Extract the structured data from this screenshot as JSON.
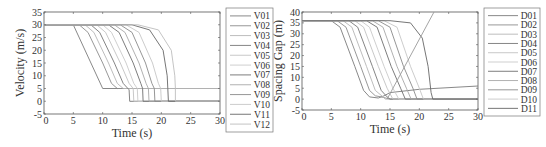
{
  "chart_data": [
    {
      "type": "line",
      "id": "velocity",
      "xlabel": "Time (s)",
      "ylabel": "Velocity (m/s)",
      "xlim": [
        0,
        30
      ],
      "ylim": [
        -5,
        35
      ],
      "xticks": [
        0,
        5,
        10,
        15,
        20,
        25,
        30
      ],
      "yticks": [
        -5,
        0,
        5,
        10,
        15,
        20,
        25,
        30,
        35
      ],
      "grid": false,
      "legend_position": "outside-right",
      "frame": {
        "x0": 44,
        "x1": 220,
        "y0": 114,
        "y1": 12
      },
      "legend_box": {
        "x": 226,
        "y": 8,
        "w": 47,
        "h": 124
      },
      "series": [
        {
          "name": "V01",
          "color": "#7a7a7a",
          "points": [
            [
              0,
              30
            ],
            [
              5,
              30
            ],
            [
              10,
              5
            ],
            [
              30,
              5
            ]
          ]
        },
        {
          "name": "V02",
          "color": "#8c8c8c",
          "points": [
            [
              0,
              30
            ],
            [
              6,
              30
            ],
            [
              7.5,
              27
            ],
            [
              10,
              15
            ],
            [
              11.5,
              7
            ],
            [
              12.5,
              5
            ],
            [
              30,
              5
            ]
          ]
        },
        {
          "name": "V03",
          "color": "#b5b5b5",
          "points": [
            [
              0,
              30
            ],
            [
              7,
              30
            ],
            [
              8.5,
              27
            ],
            [
              11,
              15
            ],
            [
              12.5,
              7
            ],
            [
              13.5,
              5
            ],
            [
              30,
              5
            ]
          ]
        },
        {
          "name": "V04",
          "color": "#777777",
          "points": [
            [
              0,
              30
            ],
            [
              8,
              30
            ],
            [
              9.5,
              27
            ],
            [
              12,
              15
            ],
            [
              13.5,
              7
            ],
            [
              14.5,
              4.5
            ],
            [
              14.6,
              0
            ],
            [
              30,
              0
            ]
          ]
        },
        {
          "name": "V05",
          "color": "#c2c2c2",
          "points": [
            [
              0,
              30
            ],
            [
              9,
              30
            ],
            [
              10.5,
              27
            ],
            [
              13,
              15
            ],
            [
              14.5,
              7
            ],
            [
              15.2,
              5
            ],
            [
              15.3,
              0
            ],
            [
              30,
              0
            ]
          ]
        },
        {
          "name": "V06",
          "color": "#c9c9c9",
          "points": [
            [
              0,
              30
            ],
            [
              10,
              30
            ],
            [
              11.5,
              27
            ],
            [
              14,
              15
            ],
            [
              15.3,
              7
            ],
            [
              15.9,
              5
            ],
            [
              16,
              0
            ],
            [
              30,
              0
            ]
          ]
        },
        {
          "name": "V07",
          "color": "#6e6e6e",
          "points": [
            [
              0,
              30
            ],
            [
              11,
              30
            ],
            [
              12.8,
              27
            ],
            [
              15.2,
              15
            ],
            [
              16.5,
              7
            ],
            [
              16.8,
              5
            ],
            [
              16.9,
              0
            ],
            [
              30,
              0
            ]
          ]
        },
        {
          "name": "V08",
          "color": "#a8a8a8",
          "points": [
            [
              0,
              30
            ],
            [
              12,
              30
            ],
            [
              13.8,
              27
            ],
            [
              16.2,
              15
            ],
            [
              17.4,
              7
            ],
            [
              17.8,
              5
            ],
            [
              17.9,
              0
            ],
            [
              30,
              0
            ]
          ]
        },
        {
          "name": "V09",
          "color": "#8a8a8a",
          "points": [
            [
              0,
              30
            ],
            [
              13,
              30
            ],
            [
              15,
              27
            ],
            [
              17.3,
              15
            ],
            [
              18.4,
              7
            ],
            [
              18.8,
              5
            ],
            [
              18.9,
              0
            ],
            [
              30,
              0
            ]
          ]
        },
        {
          "name": "V10",
          "color": "#c6c6c6",
          "points": [
            [
              0,
              30
            ],
            [
              14,
              30
            ],
            [
              16.2,
              27
            ],
            [
              18.5,
              15
            ],
            [
              19.5,
              7
            ],
            [
              19.9,
              5
            ],
            [
              20,
              0
            ],
            [
              30,
              0
            ]
          ]
        },
        {
          "name": "V11",
          "color": "#666666",
          "points": [
            [
              0,
              30
            ],
            [
              15,
              30
            ],
            [
              18,
              28
            ],
            [
              20.3,
              20
            ],
            [
              21,
              10
            ],
            [
              21.1,
              5
            ],
            [
              21.2,
              0
            ],
            [
              30,
              0
            ]
          ]
        },
        {
          "name": "V12",
          "color": "#bdbdbd",
          "points": [
            [
              0,
              30
            ],
            [
              16,
              30
            ],
            [
              19.5,
              28
            ],
            [
              21.7,
              20
            ],
            [
              22.3,
              10
            ],
            [
              22.4,
              5
            ],
            [
              22.4,
              0
            ],
            [
              30,
              0
            ]
          ]
        }
      ]
    },
    {
      "type": "line",
      "id": "spacing",
      "xlabel": "Time (s)",
      "ylabel": "Spacing Gap (m)",
      "xlim": [
        0,
        30
      ],
      "ylim": [
        -5,
        40
      ],
      "xticks": [
        0,
        5,
        10,
        15,
        20,
        25,
        30
      ],
      "yticks": [
        -5,
        0,
        5,
        10,
        15,
        20,
        25,
        30,
        35,
        40
      ],
      "grid": false,
      "legend_position": "outside-right",
      "frame": {
        "x0": 302,
        "x1": 478,
        "y0": 110,
        "y1": 12
      },
      "legend_box": {
        "x": 484,
        "y": 8,
        "w": 56,
        "h": 108
      },
      "series": [
        {
          "name": "D01",
          "color": "#7a7a7a",
          "points": [
            [
              0,
              36
            ],
            [
              5,
              36
            ],
            [
              6.5,
              33
            ],
            [
              9,
              15
            ],
            [
              10.5,
              4
            ],
            [
              11.5,
              1
            ],
            [
              13,
              0.5
            ],
            [
              14,
              1.5
            ],
            [
              15,
              3
            ],
            [
              20,
              4.5
            ],
            [
              30,
              6
            ]
          ]
        },
        {
          "name": "D02",
          "color": "#8c8c8c",
          "points": [
            [
              0,
              36
            ],
            [
              6,
              36
            ],
            [
              7.5,
              33
            ],
            [
              10,
              15
            ],
            [
              11.5,
              4
            ],
            [
              12.5,
              1.5
            ],
            [
              13.5,
              1
            ],
            [
              15,
              0
            ],
            [
              30,
              0
            ]
          ]
        },
        {
          "name": "D03",
          "color": "#b5b5b5",
          "points": [
            [
              0,
              36
            ],
            [
              7,
              36
            ],
            [
              8.5,
              33
            ],
            [
              11,
              15
            ],
            [
              12.5,
              4
            ],
            [
              13.8,
              1
            ],
            [
              14.2,
              0
            ],
            [
              30,
              0
            ]
          ]
        },
        {
          "name": "D04",
          "color": "#777777",
          "points": [
            [
              0,
              36
            ],
            [
              8,
              36
            ],
            [
              9.5,
              33
            ],
            [
              12,
              15
            ],
            [
              13.5,
              4
            ],
            [
              14.5,
              1
            ],
            [
              15,
              0
            ],
            [
              30,
              0
            ]
          ]
        },
        {
          "name": "D05",
          "color": "#c2c2c2",
          "points": [
            [
              0,
              36
            ],
            [
              9,
              36
            ],
            [
              10.5,
              33
            ],
            [
              13,
              15
            ],
            [
              14.5,
              5
            ],
            [
              15.5,
              0
            ],
            [
              30,
              0
            ]
          ]
        },
        {
          "name": "D06",
          "color": "#c9c9c9",
          "points": [
            [
              0,
              36
            ],
            [
              10,
              36
            ],
            [
              11.5,
              33
            ],
            [
              14,
              15
            ],
            [
              15.5,
              5
            ],
            [
              16.5,
              0
            ],
            [
              30,
              0
            ]
          ]
        },
        {
          "name": "D07",
          "color": "#6e6e6e",
          "points": [
            [
              0,
              36
            ],
            [
              11,
              36
            ],
            [
              12.8,
              33
            ],
            [
              15.2,
              15
            ],
            [
              16.8,
              5
            ],
            [
              17.6,
              0
            ],
            [
              30,
              0
            ]
          ]
        },
        {
          "name": "D08",
          "color": "#a8a8a8",
          "points": [
            [
              0,
              36
            ],
            [
              12,
              36
            ],
            [
              13.8,
              33
            ],
            [
              16.2,
              15
            ],
            [
              17.8,
              5
            ],
            [
              18.6,
              0
            ],
            [
              30,
              0
            ]
          ]
        },
        {
          "name": "D09",
          "color": "#8a8a8a",
          "points": [
            [
              0,
              36
            ],
            [
              13,
              36
            ],
            [
              15,
              33
            ],
            [
              17.3,
              15
            ],
            [
              18.9,
              5
            ],
            [
              19.6,
              0
            ],
            [
              30,
              0
            ]
          ]
        },
        {
          "name": "D10",
          "color": "#c6c6c6",
          "points": [
            [
              0,
              36
            ],
            [
              14,
              36
            ],
            [
              16.2,
              33
            ],
            [
              18.5,
              15
            ],
            [
              20,
              5
            ],
            [
              20.7,
              0
            ],
            [
              30,
              0
            ]
          ]
        },
        {
          "name": "D11",
          "color": "#666666",
          "points": [
            [
              0,
              36
            ],
            [
              15,
              36
            ],
            [
              18.5,
              35
            ],
            [
              20.5,
              28
            ],
            [
              21.5,
              15
            ],
            [
              22,
              3
            ],
            [
              22.3,
              0
            ],
            [
              30,
              0
            ]
          ]
        },
        {
          "name": "D12",
          "color": "#9a9a9a",
          "points": [
            [
              14.5,
              0
            ],
            [
              22.5,
              40
            ]
          ],
          "in_legend": false
        }
      ]
    }
  ]
}
